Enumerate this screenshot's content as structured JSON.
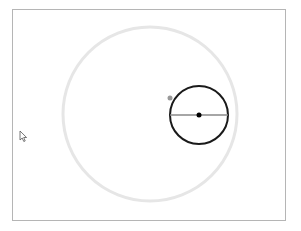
{
  "canvas": {
    "background": "#ffffff",
    "border_color": "#b5b5b5"
  },
  "shapes": {
    "big_circle": {
      "cx": 150,
      "cy": 114,
      "r": 87,
      "stroke": "#e6e6e6",
      "stroke_width": 3
    },
    "small_circle": {
      "cx": 199,
      "cy": 115,
      "r": 29,
      "stroke": "#1a1a1a",
      "stroke_width": 2
    },
    "diameter_line": {
      "x1": 170,
      "y1": 115,
      "x2": 228,
      "y2": 115,
      "stroke": "#888888"
    },
    "center_dot": {
      "cx": 199,
      "cy": 115,
      "r": 2.5,
      "fill": "#000000"
    },
    "handle_dot": {
      "cx": 170,
      "cy": 98,
      "r": 2.5,
      "fill": "#999999"
    }
  },
  "cursor": {
    "x": 20,
    "y": 131,
    "icon": "arrow-cursor-icon"
  }
}
